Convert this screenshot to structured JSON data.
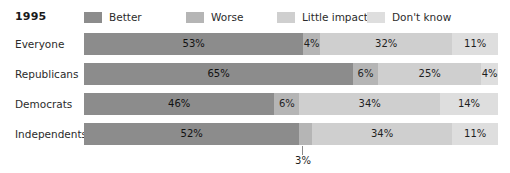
{
  "header": {
    "year_title": "1995"
  },
  "colors": {
    "better": "#8c8c8c",
    "worse": "#b5b5b5",
    "little_impact": "#cfcfcf",
    "dont_know": "#dedede",
    "text": "#2b2b2b",
    "callout_line": "#8a8a8a",
    "background": "#ffffff"
  },
  "legend": {
    "items": [
      {
        "label": "Better",
        "color_key": "better",
        "swatch_name": "legend-swatch-better"
      },
      {
        "label": "Worse",
        "color_key": "worse",
        "swatch_name": "legend-swatch-worse"
      },
      {
        "label": "Little impact",
        "color_key": "little_impact",
        "swatch_name": "legend-swatch-little-impact"
      },
      {
        "label": "Don't know",
        "color_key": "dont_know",
        "swatch_name": "legend-swatch-dont-know"
      }
    ]
  },
  "rows": [
    {
      "label": "Everyone",
      "segments": [
        {
          "label": "Better",
          "value": 53,
          "value_text": "53%",
          "show_value": true
        },
        {
          "label": "Worse",
          "value": 4,
          "value_text": "4%",
          "show_value": true
        },
        {
          "label": "Little impact",
          "value": 32,
          "value_text": "32%",
          "show_value": true
        },
        {
          "label": "Don't know",
          "value": 11,
          "value_text": "11%",
          "show_value": true
        }
      ]
    },
    {
      "label": "Republicans",
      "segments": [
        {
          "label": "Better",
          "value": 65,
          "value_text": "65%",
          "show_value": true
        },
        {
          "label": "Worse",
          "value": 6,
          "value_text": "6%",
          "show_value": true
        },
        {
          "label": "Little impact",
          "value": 25,
          "value_text": "25%",
          "show_value": true
        },
        {
          "label": "Don't know",
          "value": 4,
          "value_text": "4%",
          "show_value": true
        }
      ]
    },
    {
      "label": "Democrats",
      "segments": [
        {
          "label": "Better",
          "value": 46,
          "value_text": "46%",
          "show_value": true
        },
        {
          "label": "Worse",
          "value": 6,
          "value_text": "6%",
          "show_value": true
        },
        {
          "label": "Little impact",
          "value": 34,
          "value_text": "34%",
          "show_value": true
        },
        {
          "label": "Don't know",
          "value": 14,
          "value_text": "14%",
          "show_value": true
        }
      ]
    },
    {
      "label": "Independents",
      "segments": [
        {
          "label": "Better",
          "value": 52,
          "value_text": "52%",
          "show_value": true
        },
        {
          "label": "Worse",
          "value": 3,
          "value_text": "3%",
          "show_value": false
        },
        {
          "label": "Little impact",
          "value": 34,
          "value_text": "34%",
          "show_value": true
        },
        {
          "label": "Don't know",
          "value": 11,
          "value_text": "11%",
          "show_value": true
        }
      ]
    }
  ],
  "callout": {
    "label": "3%",
    "refers_to_row": "Independents",
    "refers_to_series": "Worse"
  },
  "chart_data": {
    "type": "bar",
    "orientation": "horizontal",
    "stacked": true,
    "title": "1995",
    "xlabel": "",
    "ylabel": "",
    "xlim": [
      0,
      100
    ],
    "grid": false,
    "legend_position": "top",
    "units": "percent",
    "categories": [
      "Everyone",
      "Republicans",
      "Democrats",
      "Independents"
    ],
    "series": [
      {
        "name": "Better",
        "color": "#8c8c8c",
        "values": [
          53,
          65,
          46,
          52
        ]
      },
      {
        "name": "Worse",
        "color": "#b5b5b5",
        "values": [
          4,
          6,
          6,
          3
        ]
      },
      {
        "name": "Little impact",
        "color": "#cfcfcf",
        "values": [
          32,
          25,
          34,
          34
        ]
      },
      {
        "name": "Don't know",
        "color": "#dedede",
        "values": [
          11,
          4,
          14,
          11
        ]
      }
    ],
    "annotations": [
      {
        "text": "3%",
        "category": "Independents",
        "series": "Worse",
        "value": 3,
        "placement": "below-bar-with-leader-line"
      }
    ]
  }
}
